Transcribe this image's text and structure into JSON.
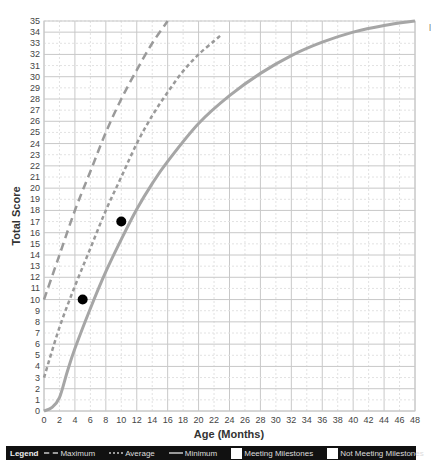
{
  "chart_data": {
    "type": "line",
    "title": "",
    "xlabel": "Age (Months)",
    "ylabel": "Total Score",
    "xlim": [
      0,
      48
    ],
    "ylim": [
      0,
      35
    ],
    "x_ticks": [
      0,
      2,
      4,
      6,
      8,
      10,
      12,
      14,
      16,
      18,
      20,
      22,
      24,
      26,
      28,
      30,
      32,
      34,
      36,
      38,
      40,
      42,
      44,
      46,
      48
    ],
    "y_ticks": [
      0,
      1,
      2,
      3,
      4,
      5,
      6,
      7,
      8,
      9,
      10,
      11,
      12,
      13,
      14,
      15,
      16,
      17,
      18,
      19,
      20,
      21,
      22,
      23,
      24,
      25,
      26,
      27,
      28,
      29,
      30,
      31,
      32,
      33,
      34,
      35
    ],
    "grid": true,
    "legend_position": "bottom",
    "series": [
      {
        "name": "Maximum",
        "style": "long-dash",
        "color": "#9a9a9a",
        "points": [
          [
            0,
            10
          ],
          [
            2,
            14
          ],
          [
            4,
            18
          ],
          [
            6,
            21.5
          ],
          [
            8,
            25
          ],
          [
            10,
            28
          ],
          [
            12,
            30.6
          ],
          [
            14,
            33
          ],
          [
            16,
            35
          ]
        ]
      },
      {
        "name": "Average",
        "style": "short-dash",
        "color": "#9a9a9a",
        "points": [
          [
            0,
            3
          ],
          [
            2,
            7.5
          ],
          [
            4,
            11.2
          ],
          [
            6,
            14.6
          ],
          [
            8,
            18
          ],
          [
            10,
            21
          ],
          [
            12,
            24
          ],
          [
            14,
            26.5
          ],
          [
            16,
            28.6
          ],
          [
            18,
            30.5
          ],
          [
            20,
            32
          ],
          [
            22,
            33.2
          ],
          [
            23,
            33.8
          ]
        ]
      },
      {
        "name": "Minimum",
        "style": "solid",
        "color": "#a6a6a6",
        "points": [
          [
            0,
            0
          ],
          [
            1,
            0.3
          ],
          [
            2,
            1.2
          ],
          [
            3,
            3.5
          ],
          [
            4,
            5.6
          ],
          [
            6,
            9.2
          ],
          [
            8,
            12.5
          ],
          [
            10,
            15.4
          ],
          [
            12,
            18.1
          ],
          [
            14,
            20.4
          ],
          [
            16,
            22.4
          ],
          [
            20,
            25.8
          ],
          [
            24,
            28.3
          ],
          [
            28,
            30.3
          ],
          [
            32,
            31.9
          ],
          [
            36,
            33.1
          ],
          [
            40,
            34
          ],
          [
            44,
            34.6
          ],
          [
            48,
            35
          ]
        ]
      },
      {
        "name": "Meeting Milestones",
        "style": "marker",
        "color": "#000000",
        "points": [
          [
            5,
            10
          ],
          [
            10,
            17
          ]
        ]
      }
    ]
  },
  "legend": {
    "title": "Legend",
    "items": [
      {
        "label": "Maximum",
        "kind": "line-long-dash"
      },
      {
        "label": "Average",
        "kind": "line-short-dash"
      },
      {
        "label": "Minimum",
        "kind": "line-solid"
      },
      {
        "label": "Meeting Milestones",
        "kind": "box"
      },
      {
        "label": "Not Meeting Milestones",
        "kind": "box"
      }
    ]
  },
  "colors": {
    "grid_major": "#c8c8c8",
    "grid_minor": "#e2e2e2",
    "curve": "#9a9a9a",
    "marker": "#000000",
    "legend_bg": "#111111"
  }
}
